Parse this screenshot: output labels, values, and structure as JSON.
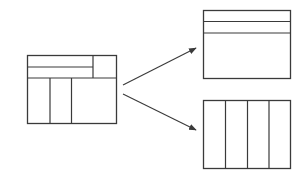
{
  "diagram": {
    "stroke_color": "#3a3a3a",
    "background_color": "#ffffff",
    "source_layout": {
      "name": "combined-layout",
      "top_rows": 2,
      "top_right_cell": 1,
      "bottom_columns": 3
    },
    "targets": [
      {
        "name": "rows-layout",
        "rows": 3
      },
      {
        "name": "columns-layout",
        "columns": 4
      }
    ],
    "arrows": [
      {
        "from": "combined-layout",
        "to": "rows-layout"
      },
      {
        "from": "combined-layout",
        "to": "columns-layout"
      }
    ]
  }
}
